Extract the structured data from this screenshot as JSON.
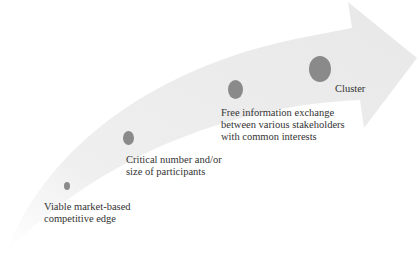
{
  "diagram": {
    "type": "curved-progression-arrow",
    "colors": {
      "arrow": "#ececec",
      "dot": "#8a8a8a",
      "text": "#333333"
    },
    "stages": [
      {
        "line1": "Viable market-based",
        "line2": "competitive edge"
      },
      {
        "line1": "Critical number and/or",
        "line2": "size of participants"
      },
      {
        "line1": "Free information exchange",
        "line2": "between various stakeholders",
        "line3": "with common interests"
      },
      {
        "line1": "Cluster"
      }
    ]
  }
}
